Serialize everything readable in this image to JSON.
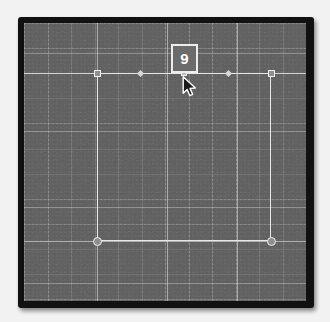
{
  "app": {
    "title": "Design Canvas",
    "canvas_background": "#5c5c5c",
    "bezel_color": "#111111",
    "stroke_color": "#e8e8e8",
    "grid": {
      "minor_spacing_px": 23.5,
      "major_spacing_px": 70,
      "visible": true,
      "style": "dotted"
    }
  },
  "badge": {
    "value": "9",
    "name": "spacing-value-badge",
    "text_color": "#ffffff",
    "border_color": "#ededed",
    "fill_color": "#6b6b6b"
  },
  "selection": {
    "shape_type": "rectangle",
    "left": 73,
    "top": 50,
    "width": 174,
    "height": 168,
    "handles": [
      {
        "name": "handle-top-left",
        "kind": "square",
        "x": 73,
        "y": 50
      },
      {
        "name": "handle-top-middle",
        "kind": "mid",
        "x": 160,
        "y": 50
      },
      {
        "name": "handle-top-right",
        "kind": "square",
        "x": 247,
        "y": 50
      },
      {
        "name": "handle-bottom-left",
        "kind": "circle",
        "x": 73,
        "y": 218
      },
      {
        "name": "handle-bottom-right",
        "kind": "circle",
        "x": 247,
        "y": 218
      }
    ],
    "markers": [
      {
        "name": "marker-left",
        "x": 116,
        "y": 50
      },
      {
        "name": "marker-right",
        "x": 204,
        "y": 50
      }
    ]
  },
  "guides": {
    "horizontal_top_y": 50,
    "horizontal_bottom_y": 218
  },
  "major_grid": {
    "vertical_x": [
      73,
      143,
      213,
      282
    ],
    "horizontal_y": [
      30,
      108,
      184,
      260
    ]
  },
  "cursor": {
    "name": "arrow-pointer-cursor",
    "x": 160,
    "y": 54
  }
}
